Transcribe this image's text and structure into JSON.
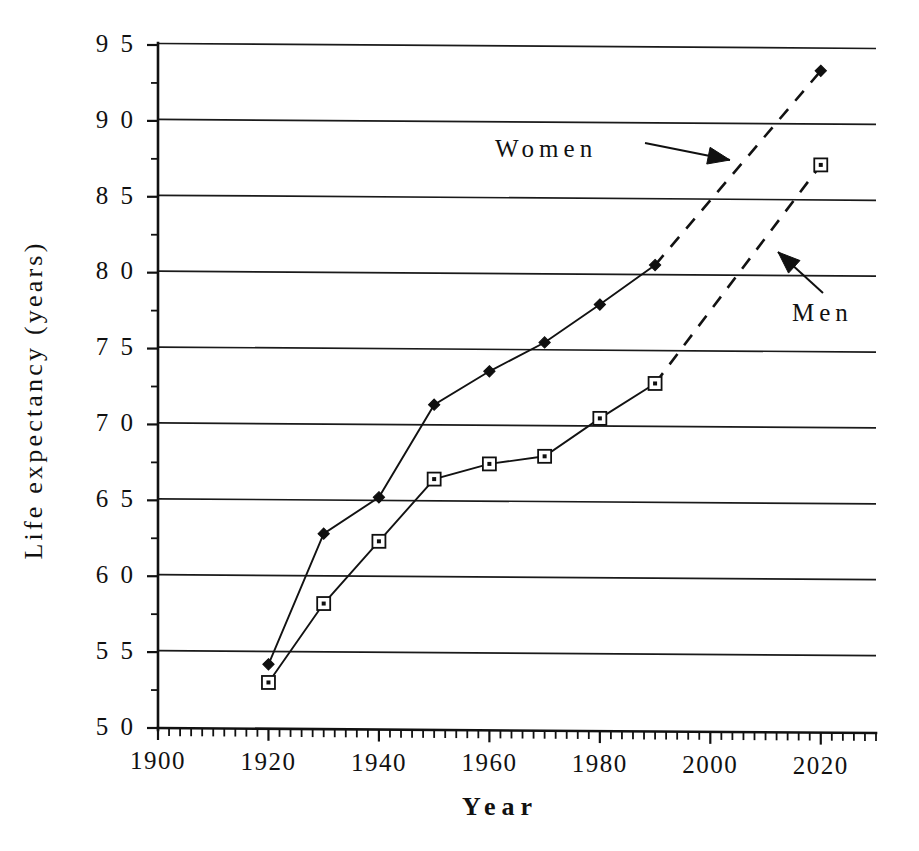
{
  "chart_data": {
    "type": "line",
    "title": "",
    "xlabel": "Year",
    "ylabel": "Life expectancy (years)",
    "xlim": [
      1900,
      2030
    ],
    "ylim": [
      50,
      95
    ],
    "xticks": [
      1900,
      1920,
      1940,
      1960,
      1980,
      2000,
      2020
    ],
    "xtick_labels": [
      "1900",
      "1920",
      "1940",
      "1960",
      "1980",
      "2000",
      "2020"
    ],
    "yticks": [
      50,
      55,
      60,
      65,
      70,
      75,
      80,
      85,
      90,
      95
    ],
    "ytick_labels": [
      "5 0",
      "5 5",
      "6 0",
      "6 5",
      "7 0",
      "7 5",
      "8 0",
      "8 5",
      "9 0",
      "9 5"
    ],
    "x_minor_tick_step": 2,
    "y_minor_tick_step": 2.5,
    "grid": "horizontal",
    "legend": "inline-annotations",
    "series": [
      {
        "name": "Women",
        "marker": "filled-diamond",
        "linestyle": "solid",
        "x": [
          1920,
          1930,
          1940,
          1950,
          1960,
          1970,
          1980,
          1990
        ],
        "values": [
          54.2,
          62.8,
          65.2,
          71.3,
          73.5,
          75.4,
          77.9,
          80.5
        ]
      },
      {
        "name": "Women (projected)",
        "marker": "filled-diamond",
        "linestyle": "dashed",
        "x": [
          1990,
          2020
        ],
        "values": [
          80.5,
          93.3
        ]
      },
      {
        "name": "Men",
        "marker": "open-square",
        "linestyle": "solid",
        "x": [
          1920,
          1930,
          1940,
          1950,
          1960,
          1970,
          1980,
          1990
        ],
        "values": [
          53.0,
          58.2,
          62.3,
          66.4,
          67.4,
          67.9,
          70.4,
          72.7
        ]
      },
      {
        "name": "Men (projected)",
        "marker": "open-square",
        "linestyle": "dashed",
        "x": [
          1990,
          2020
        ],
        "values": [
          72.7,
          87.1
        ]
      }
    ],
    "annotations": [
      {
        "label": "Women",
        "text_x": 495,
        "text_y": 157,
        "arrow_from_x": 645,
        "arrow_from_y": 143,
        "arrow_to_x": 730,
        "arrow_to_y": 160
      },
      {
        "label": "Men",
        "text_x": 792,
        "text_y": 321,
        "arrow_from_x": 823,
        "arrow_from_y": 293,
        "arrow_to_x": 778,
        "arrow_to_y": 252
      }
    ]
  },
  "colors": {
    "ink": "#111111",
    "background": "#ffffff"
  }
}
